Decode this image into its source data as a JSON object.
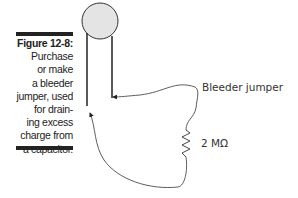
{
  "caption": {
    "label": "Figure 12-8:",
    "lines": [
      "Purchase",
      "or make",
      "a bleeder",
      "jumper, used",
      "for drain-",
      "ing excess",
      "charge from",
      "a capacitor."
    ]
  },
  "diagram": {
    "jumper_label": "Bleeder jumper",
    "resistor_label": "2 MΩ",
    "capacitor_color": "#e4e4e4"
  }
}
